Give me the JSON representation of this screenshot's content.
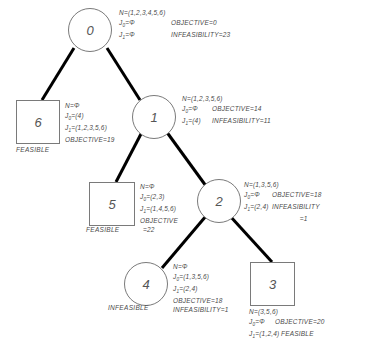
{
  "diagram": {
    "type": "branch-and-bound-tree",
    "title": "",
    "edge_color": "#000000",
    "node_stroke": "#7a7a7a",
    "text_color": "#4a4a4a",
    "background": "#ffffff",
    "symbols": {
      "empty_set": "Φ",
      "equals": "="
    }
  },
  "nodes": [
    {
      "id": "0",
      "label": "0",
      "shape": "circle",
      "N": "N=(1,2,3,4,5,6)",
      "J0": "J",
      "J0_sub": "0",
      "J0_val": "=Φ",
      "J1": "J",
      "J1_sub": "1",
      "J1_val": "=Φ",
      "objective": "OBJECTIVE=0",
      "infeasibility": "INFEASIBILITY=23",
      "status": ""
    },
    {
      "id": "6",
      "label": "6",
      "shape": "square",
      "N": "N=Φ",
      "J0": "J",
      "J0_sub": "0",
      "J0_val": "=(4)",
      "J1": "J",
      "J1_sub": "1",
      "J1_val": "=(1,2,3,5,6)",
      "objective": "OBJECTIVE=19",
      "infeasibility": "",
      "status": "FEASIBLE"
    },
    {
      "id": "1",
      "label": "1",
      "shape": "circle",
      "N": "N=(1,2,3,5,6)",
      "J0": "J",
      "J0_sub": "0",
      "J0_val": "=Φ",
      "J1": "J",
      "J1_sub": "1",
      "J1_val": "=(4)",
      "objective": "OBJECTIVE=14",
      "infeasibility": "INFEASIBILITY=11",
      "status": ""
    },
    {
      "id": "5",
      "label": "5",
      "shape": "square",
      "N": "N=Φ",
      "J0": "J",
      "J0_sub": "0",
      "J0_val": "=(2,3)",
      "J1": "J",
      "J1_sub": "1",
      "J1_val": "=(1,4,5,6)",
      "objective": "OBJECTIVE",
      "objective2": "=22",
      "infeasibility": "",
      "status": "FEASIBLE"
    },
    {
      "id": "2",
      "label": "2",
      "shape": "circle",
      "N": "N=(1,3,5,6)",
      "J0": "J",
      "J0_sub": "0",
      "J0_val": "=Φ",
      "J1": "J",
      "J1_sub": "1",
      "J1_val": "=(2,4)",
      "objective": "OBJECTIVE=18",
      "infeasibility": "INFEASIBILITY",
      "infeasibility2": "=1",
      "status": ""
    },
    {
      "id": "4",
      "label": "4",
      "shape": "circle",
      "N": "N=Φ",
      "J0": "J",
      "J0_sub": "0",
      "J0_val": "=(1,3,5,6)",
      "J1": "J",
      "J1_sub": "1",
      "J1_val": "=(2,4)",
      "objective": "OBJECTIVE=18",
      "infeasibility": "INFEASIBILITY=1",
      "status": "INFEASIBLE"
    },
    {
      "id": "3",
      "label": "3",
      "shape": "square",
      "N": "N=(3,5,6)",
      "J0": "J",
      "J0_sub": "0",
      "J0_val": "=Φ",
      "J1": "J",
      "J1_sub": "1",
      "J1_val": "=(1,2,4)",
      "objective": "OBJECTIVE=20",
      "infeasibility": "",
      "status": "FEASIBLE"
    }
  ],
  "edges": [
    {
      "from": "0",
      "to": "6"
    },
    {
      "from": "0",
      "to": "1"
    },
    {
      "from": "1",
      "to": "5"
    },
    {
      "from": "1",
      "to": "2"
    },
    {
      "from": "2",
      "to": "4"
    },
    {
      "from": "2",
      "to": "3"
    }
  ]
}
